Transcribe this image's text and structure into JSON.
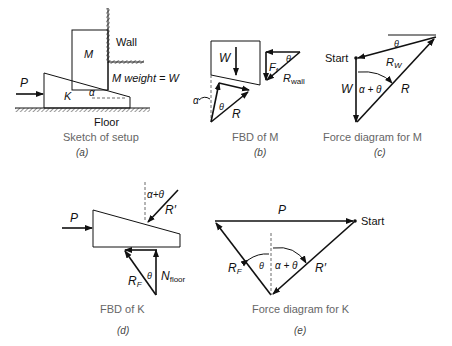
{
  "panels": [
    {
      "id": "a",
      "caption": "Sketch of setup",
      "tag": "(a)",
      "labels": {
        "wall": "Wall",
        "floor": "Floor",
        "block_m": "M",
        "wedge_k": "K",
        "force_p": "P",
        "angle": "α",
        "weight_note": "M weight = W"
      }
    },
    {
      "id": "b",
      "caption": "FBD of M",
      "tag": "(b)",
      "labels": {
        "weight": "W",
        "friction": "F",
        "friction_sub": "f",
        "r_wall": "R",
        "r_wall_sub": "wall",
        "reaction": "R",
        "angle_theta": "θ",
        "angle_theta2": "θ",
        "angle_alpha": "α"
      }
    },
    {
      "id": "c",
      "caption": "Force diagram for M",
      "tag": "(c)",
      "labels": {
        "start": "Start",
        "rw": "R",
        "rw_sub": "W",
        "weight": "W",
        "reaction": "R",
        "angle": "α + θ",
        "theta": "θ"
      }
    },
    {
      "id": "d",
      "caption": "FBD of K",
      "tag": "(d)",
      "labels": {
        "force_p": "P",
        "r_prime": "R′",
        "angle": "α+θ",
        "rf": "R",
        "rf_sub": "F",
        "theta": "θ",
        "n": "N",
        "n_sub": "floor"
      }
    },
    {
      "id": "e",
      "caption": "Force diagram for K",
      "tag": "(e)",
      "labels": {
        "force_p": "P",
        "start": "Start",
        "rf": "R",
        "rf_sub": "F",
        "r_prime": "R′",
        "theta": "θ",
        "angle": "α + θ"
      }
    }
  ]
}
